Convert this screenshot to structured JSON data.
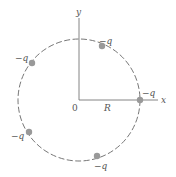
{
  "figure": {
    "type": "charges-on-circle",
    "axes": {
      "x_label": "x",
      "y_label": "y",
      "origin_label": "0",
      "radius_label": "R"
    },
    "circle": {
      "style": "dashed",
      "center": [
        79,
        100
      ],
      "radius": 61,
      "color": "#666666"
    },
    "charges": [
      {
        "label": "−q",
        "angle_deg": 0,
        "label_pos": "above-right"
      },
      {
        "label": "−q",
        "angle_deg": 68,
        "label_pos": "above-right"
      },
      {
        "label": "−q",
        "angle_deg": 128,
        "label_pos": "left"
      },
      {
        "label": "−q",
        "angle_deg": 212,
        "label_pos": "left"
      },
      {
        "label": "−q",
        "angle_deg": 293,
        "label_pos": "below"
      }
    ],
    "charge_color": "#999999",
    "axis_color": "#777777"
  }
}
